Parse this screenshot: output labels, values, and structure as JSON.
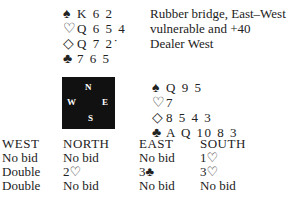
{
  "info": {
    "line1": "Rubber bridge, East–West",
    "line2": "vulnerable and +40",
    "line3": "Dealer West"
  },
  "north": {
    "spades": {
      "sym": "♠",
      "cards": "K 6 2"
    },
    "hearts": {
      "sym": "♡",
      "cards": "Q 6 5 4"
    },
    "diamonds": {
      "sym": "◇",
      "cards": "Q 7 2˙"
    },
    "clubs": {
      "sym": "♣",
      "cards": "7 6 5"
    }
  },
  "east": {
    "spades": {
      "sym": "♠",
      "cards": "Q 9 5"
    },
    "hearts": {
      "sym": "♡",
      "cards": "7"
    },
    "diamonds": {
      "sym": "◇",
      "cards": "8 5 4 3"
    },
    "clubs": {
      "sym": "♣",
      "cards": "A Q 10 8 3"
    }
  },
  "compass": {
    "n": "N",
    "w": "W",
    "e": "E",
    "s": "S"
  },
  "auction": {
    "headers": [
      "WEST",
      "NORTH",
      "EAST",
      "SOUTH"
    ],
    "rows": [
      [
        "No bid",
        "No bid",
        "No bid",
        "1♡"
      ],
      [
        "Double",
        "2♡",
        "3♣",
        "3♡"
      ],
      [
        "Double",
        "No bid",
        "No bid",
        "No bid"
      ]
    ]
  }
}
